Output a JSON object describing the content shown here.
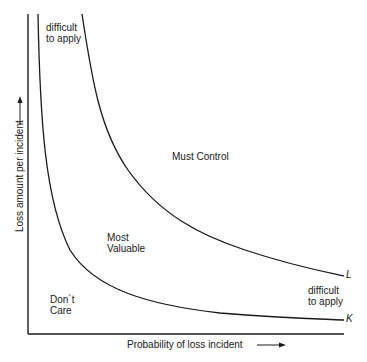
{
  "diagram": {
    "x_axis_label": "Probability of loss incident",
    "y_axis_label": "Loss amount per incident",
    "regions": {
      "top_left": [
        "difficult",
        "to apply"
      ],
      "must_control": "Must Control",
      "most_valuable": [
        "Most",
        "Valuable"
      ],
      "dont_care": [
        "Don´t",
        "Care"
      ],
      "bottom_right": [
        "difficult",
        "to apply"
      ]
    },
    "curves": [
      {
        "name": "L",
        "label": "L"
      },
      {
        "name": "K",
        "label": "K"
      }
    ],
    "colors": {
      "line": "#1a1a1a",
      "background": "#ffffff"
    }
  }
}
